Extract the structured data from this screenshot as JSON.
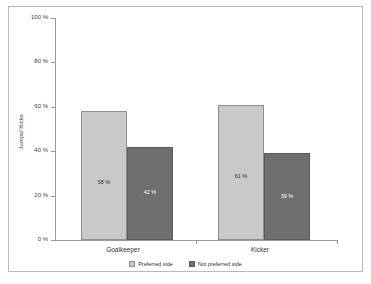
{
  "chart_data": {
    "type": "bar",
    "title": "",
    "xlabel": "",
    "ylabel": "Jumps/ Kicks",
    "ylim": [
      0,
      100
    ],
    "yunit": "%",
    "grid": false,
    "legend_position": "bottom",
    "categories": [
      "Goalkeeper",
      "Kicker"
    ],
    "ytick_labels": [
      "100 %",
      "80 %",
      "60 %",
      "40 %",
      "20 %",
      "0 %"
    ],
    "ytick_values": [
      100,
      80,
      60,
      40,
      20,
      0
    ],
    "series": [
      {
        "name": "Preferred side",
        "color": "#c9c9c9",
        "values": [
          58,
          61
        ],
        "data_labels": [
          "58 %",
          "61 %"
        ]
      },
      {
        "name": "Not preferred side",
        "color": "#6f6f6f",
        "values": [
          42,
          39
        ],
        "data_labels": [
          "42 %",
          "39 %"
        ]
      }
    ]
  }
}
